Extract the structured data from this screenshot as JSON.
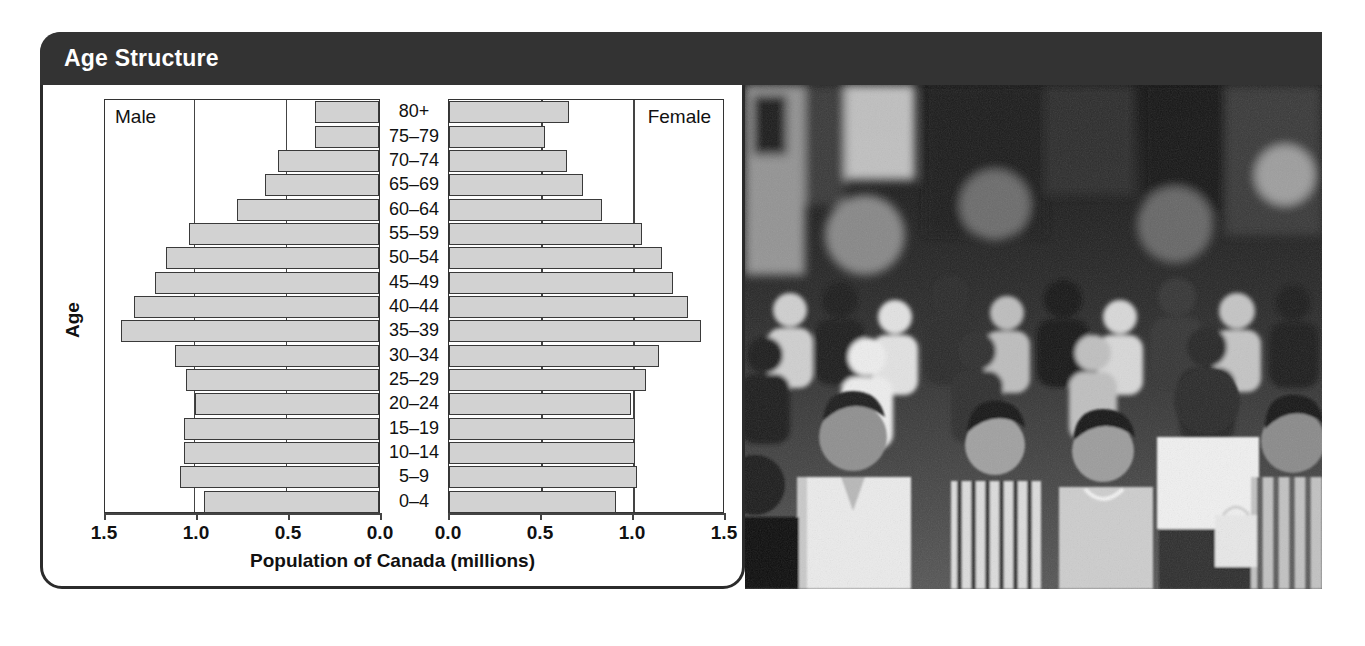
{
  "header": {
    "title": "Age Structure"
  },
  "chart_data": {
    "type": "bar",
    "subtype": "population-pyramid",
    "title": "Age Structure",
    "xlabel": "Population of Canada (millions)",
    "ylabel": "Age",
    "xlim": [
      0,
      1.5
    ],
    "xticks": [
      "1.5",
      "1.0",
      "0.5",
      "0.0",
      "0.0",
      "0.5",
      "1.0",
      "1.5"
    ],
    "left_ticks": [
      "1.5",
      "1.0",
      "0.5",
      "0.0"
    ],
    "right_ticks": [
      "0.0",
      "0.5",
      "1.0",
      "1.5"
    ],
    "grid": true,
    "legend_position": "in-plot-corners",
    "categories": [
      "80+",
      "75–79",
      "70–74",
      "65–69",
      "60–64",
      "55–59",
      "50–54",
      "45–49",
      "40–44",
      "35–39",
      "30–34",
      "25–29",
      "20–24",
      "15–19",
      "10–14",
      "5–9",
      "0–4"
    ],
    "series": [
      {
        "name": "Male",
        "side": "left",
        "values": [
          0.35,
          0.35,
          0.55,
          0.62,
          0.77,
          1.03,
          1.16,
          1.22,
          1.33,
          1.4,
          1.11,
          1.05,
          1.0,
          1.06,
          1.06,
          1.08,
          0.95
        ]
      },
      {
        "name": "Female",
        "side": "right",
        "values": [
          0.65,
          0.52,
          0.64,
          0.73,
          0.83,
          1.05,
          1.16,
          1.22,
          1.3,
          1.37,
          1.14,
          1.07,
          0.99,
          1.01,
          1.01,
          1.02,
          0.91
        ]
      }
    ],
    "colors": {
      "bar_fill": "#d2d2d2",
      "bar_stroke": "#3a3a3a",
      "header_bg": "#333333",
      "header_text": "#ffffff",
      "frame": "#2b2b2b"
    }
  },
  "photo": {
    "caption": "crowd-of-people-on-city-street",
    "style": "black-and-white"
  }
}
